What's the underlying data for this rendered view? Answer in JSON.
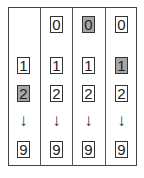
{
  "diagram": {
    "highlight_color": "#a6a6a6",
    "arrow_glyph": "↓",
    "columns": [
      {
        "cells": {
          "zero": null,
          "one": "1",
          "two": "2",
          "nine": "9"
        },
        "highlight": "2"
      },
      {
        "cells": {
          "zero": "0",
          "one": "1",
          "two": "2",
          "nine": "9"
        },
        "highlight": null
      },
      {
        "cells": {
          "zero": "0",
          "one": "1",
          "two": "2",
          "nine": "9"
        },
        "highlight": "0"
      },
      {
        "cells": {
          "zero": "0",
          "one": "1",
          "two": "2",
          "nine": "9"
        },
        "highlight": "1"
      }
    ]
  }
}
